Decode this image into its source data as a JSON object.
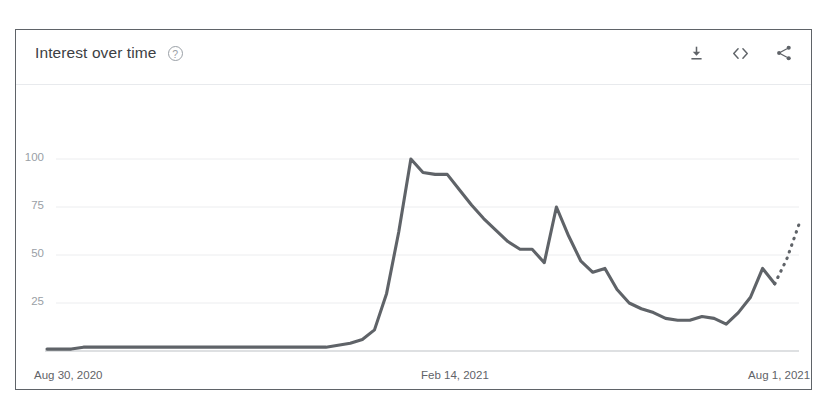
{
  "card": {
    "title": "Interest over time",
    "help_icon_label": "?",
    "actions": [
      {
        "name": "download-icon",
        "label": "Download"
      },
      {
        "name": "embed-code-icon",
        "label": "Embed"
      },
      {
        "name": "share-icon",
        "label": "Share"
      }
    ]
  },
  "colors": {
    "line": "#5f6368",
    "grid": "#ecedef",
    "axis": "#bdc1c6",
    "tick_text": "#9aa0a6",
    "xtick_text": "#5f6368",
    "card_border": "#5f6368",
    "background": "#ffffff"
  },
  "chart_data": {
    "type": "line",
    "title": "Interest over time",
    "xlabel": "",
    "ylabel": "",
    "ylim": [
      0,
      105
    ],
    "grid": true,
    "legend": false,
    "y_ticks": [
      25,
      50,
      75,
      100
    ],
    "x_ticks": [
      "Aug 30, 2020",
      "Feb 14, 2021",
      "Aug 1, 2021"
    ],
    "x_tick_positions": [
      0,
      0.5,
      0.935
    ],
    "series": [
      {
        "name": "Interest",
        "style": "solid",
        "values": [
          1,
          1,
          1,
          2,
          2,
          2,
          2,
          2,
          2,
          2,
          2,
          2,
          2,
          2,
          2,
          2,
          2,
          2,
          2,
          2,
          2,
          2,
          2,
          2,
          3,
          4,
          6,
          11,
          30,
          62,
          100,
          93,
          92,
          92,
          84,
          76,
          69,
          63,
          57,
          53,
          53,
          46,
          75,
          60,
          47,
          41,
          43,
          32,
          25,
          22,
          20,
          17,
          16,
          16,
          18,
          17,
          14,
          20,
          28,
          43,
          35
        ]
      },
      {
        "name": "Interest (partial)",
        "style": "dotted",
        "values": [
          35,
          48,
          66
        ]
      }
    ],
    "annotations": [
      {
        "text": "Dotted segment indicates incomplete (partial) data",
        "position": "right-end"
      }
    ]
  }
}
